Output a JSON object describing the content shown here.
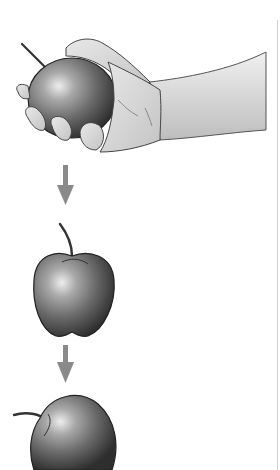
{
  "diagram": {
    "type": "sequence-illustration",
    "steps": [
      {
        "id": "held",
        "label": "hand-holding-apple",
        "icon": "hand-with-apple-icon"
      },
      {
        "id": "arrow1",
        "label": "down-arrow",
        "icon": "arrow-down-icon"
      },
      {
        "id": "falling",
        "label": "falling-apple",
        "icon": "apple-icon"
      },
      {
        "id": "arrow2",
        "label": "down-arrow",
        "icon": "arrow-down-icon"
      },
      {
        "id": "landed",
        "label": "tilted-apple",
        "icon": "apple-tilted-icon"
      }
    ],
    "colors": {
      "background": "#ffffff",
      "arrow": "#8a8a8a",
      "skin_light": "#e6e6e6",
      "skin_mid": "#c8c8c8",
      "apple_dark": "#3a3a3a",
      "apple_mid": "#7a7a7a",
      "apple_highlight": "#e8e8e8",
      "outline": "#2a2a2a"
    }
  }
}
